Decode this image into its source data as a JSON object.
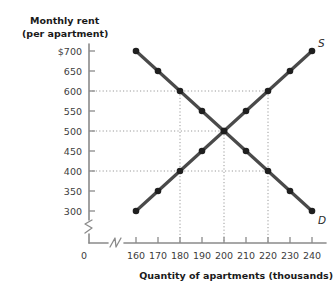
{
  "chart_data": {
    "type": "line",
    "title": "",
    "subtitle": "",
    "ylabel_line1": "Monthly rent",
    "ylabel_line2": "(per apartment)",
    "xlabel": "Quantity of apartments (thousands)",
    "x": [
      160,
      170,
      180,
      190,
      200,
      210,
      220,
      230,
      240
    ],
    "xticklabels": [
      "160",
      "170",
      "180",
      "190",
      "200",
      "210",
      "220",
      "230",
      "240"
    ],
    "yticklabels": [
      "$700",
      "650",
      "600",
      "550",
      "500",
      "450",
      "400",
      "350",
      "300"
    ],
    "yticks": [
      700,
      650,
      600,
      550,
      500,
      450,
      400,
      350,
      300
    ],
    "origin_label": "0",
    "xlim": [
      160,
      240
    ],
    "ylim": [
      300,
      700
    ],
    "grid": false,
    "axis_break_x": true,
    "axis_break_y": true,
    "legend_position": "inline-end-of-curve",
    "series": [
      {
        "name": "S",
        "label": "Supply",
        "color": "#4a4a4a",
        "values": [
          300,
          350,
          400,
          450,
          500,
          550,
          600,
          650,
          700
        ]
      },
      {
        "name": "D",
        "label": "Demand",
        "color": "#4a4a4a",
        "values": [
          700,
          650,
          600,
          550,
          500,
          450,
          400,
          350,
          300
        ]
      }
    ],
    "equilibrium": {
      "x": 200,
      "y": 500
    },
    "annotations": [
      {
        "kind": "h-guide",
        "y": 600,
        "from_x": 160,
        "to_x": 220
      },
      {
        "kind": "h-guide",
        "y": 500,
        "from_x": 160,
        "to_x": 200
      },
      {
        "kind": "h-guide",
        "y": 400,
        "from_x": 160,
        "to_x": 220
      },
      {
        "kind": "v-guide",
        "x": 180,
        "from_y": 300,
        "to_y": 600
      },
      {
        "kind": "v-guide",
        "x": 200,
        "from_y": 300,
        "to_y": 500
      },
      {
        "kind": "v-guide",
        "x": 220,
        "from_y": 300,
        "to_y": 600
      }
    ],
    "colors": {
      "line": "#4a4a4a",
      "marker": "#1f1f1f",
      "axis": "#8a8a8a",
      "guide": "#9a9a9a",
      "background": "#ffffff"
    }
  }
}
